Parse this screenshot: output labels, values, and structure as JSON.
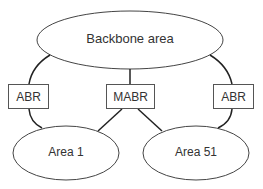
{
  "diagram": {
    "backbone": {
      "label": "Backbone area"
    },
    "routers": [
      {
        "label": "ABR"
      },
      {
        "label": "MABR"
      },
      {
        "label": "ABR"
      }
    ],
    "areas": [
      {
        "label": "Area 1"
      },
      {
        "label": "Area 51"
      }
    ]
  }
}
